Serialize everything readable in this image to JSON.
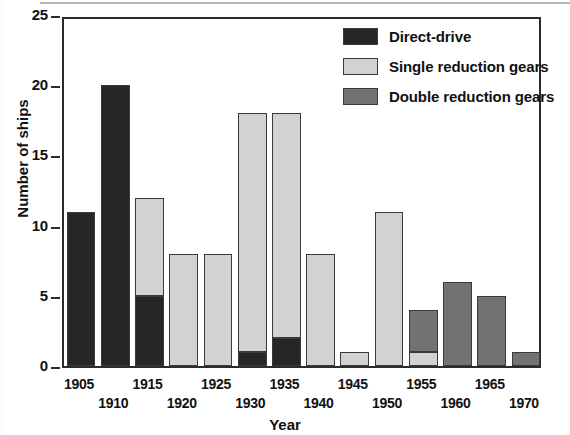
{
  "chart_data": {
    "type": "bar",
    "title": "",
    "xlabel": "Year",
    "ylabel": "Number of ships",
    "ylim": [
      0,
      25
    ],
    "yticks": [
      0,
      5,
      10,
      15,
      20,
      25
    ],
    "grid": false,
    "stacked": true,
    "legend_position": "top-right",
    "categories": [
      "1905",
      "1910",
      "1915",
      "1920",
      "1925",
      "1930",
      "1935",
      "1940",
      "1945",
      "1950",
      "1955",
      "1960",
      "1965",
      "1970"
    ],
    "series": [
      {
        "name": "Direct-drive",
        "color": "#262626",
        "values": [
          11,
          20,
          5,
          0,
          0,
          1,
          2,
          0,
          0,
          0,
          0,
          0,
          0,
          0
        ]
      },
      {
        "name": "Single reduction gears",
        "color": "#d2d2d2",
        "values": [
          0,
          0,
          7,
          8,
          8,
          17,
          16,
          8,
          1,
          11,
          1,
          0,
          0,
          0
        ]
      },
      {
        "name": "Double reduction gears",
        "color": "#727272",
        "values": [
          0,
          0,
          0,
          0,
          0,
          0,
          0,
          0,
          0,
          0,
          3,
          6,
          5,
          1
        ]
      }
    ],
    "totals": [
      11,
      20,
      12,
      8,
      8,
      18,
      18,
      8,
      1,
      11,
      4,
      6,
      5,
      1
    ]
  },
  "axes": {
    "y_label": "Number of ships",
    "x_label": "Year",
    "y_ticks": [
      "0",
      "5",
      "10",
      "15",
      "20",
      "25"
    ],
    "x_ticks": [
      "1905",
      "1910",
      "1915",
      "1920",
      "1925",
      "1930",
      "1935",
      "1940",
      "1945",
      "1950",
      "1955",
      "1960",
      "1965",
      "1970"
    ]
  },
  "legend": {
    "items": [
      {
        "label": "Direct-drive",
        "color": "#262626"
      },
      {
        "label": "Single reduction gears",
        "color": "#d2d2d2"
      },
      {
        "label": "Double reduction gears",
        "color": "#727272"
      }
    ]
  },
  "colors": {
    "axis": "#2b2b2b",
    "text": "#111111",
    "background": "#ffffff",
    "bar_outline": "#3a3a3a"
  }
}
